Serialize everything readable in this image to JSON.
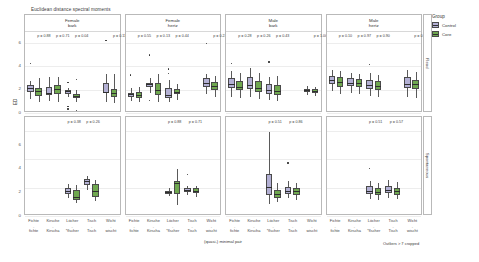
{
  "figure": {
    "title": "Euclidean distance spectral moments",
    "y_axis_label": "ED",
    "caption_center": "(quasi-) minimal pair",
    "caption_right": "Outliers > 7 cropped"
  },
  "legend": {
    "title": "Group",
    "items": [
      {
        "label": "Control",
        "color": "#b3b0d4"
      },
      {
        "label": "Core",
        "color": "#6fa84f"
      }
    ]
  },
  "row_strips": [
    {
      "label": "Read"
    },
    {
      "label": "Spontaneous"
    }
  ],
  "y_ticks": [
    "0",
    "2",
    "4",
    "6"
  ],
  "x_ticks_top": [
    "Fichte",
    "Kirsche",
    "Löcher",
    "Tisch",
    "Wicht"
  ],
  "x_ticks_dash": [
    "-",
    "-",
    "-",
    "-",
    "-"
  ],
  "x_ticks_bottom": [
    "fichte",
    "Kirscha",
    "*flscher",
    "Tisch",
    "wischt"
  ],
  "chart_data": {
    "type": "box",
    "title": "Euclidean distance spectral moments",
    "xlabel": "(quasi-) minimal pair",
    "ylabel": "ED",
    "ylim": [
      0,
      7
    ],
    "grid": true,
    "legend_position": "right",
    "note": "Outliers > 7 cropped",
    "facet_cols": [
      {
        "sex": "Female",
        "scale": "bark"
      },
      {
        "sex": "Female",
        "scale": "hertz"
      },
      {
        "sex": "Male",
        "scale": "bark"
      },
      {
        "sex": "Male",
        "scale": "hertz"
      }
    ],
    "facet_rows": [
      "Read",
      "Spontaneous"
    ],
    "categories": [
      "Fichte",
      "Kirsche",
      "Löcher",
      "Tisch",
      "Wicht"
    ],
    "groups": [
      "Control",
      "Core"
    ],
    "panels": [
      {
        "row": "Read",
        "col": "Female bark",
        "pvalues": [
          {
            "x": 0.5,
            "text": "p = 0.88"
          },
          {
            "x": 1.5,
            "text": "p = 0.71"
          },
          {
            "x": 2.5,
            "text": "p = 0.04"
          },
          {
            "x": 4.5,
            "text": "p = 0.11"
          }
        ],
        "boxes": [
          {
            "cat": "Fichte",
            "group": "Control",
            "q1": 1.75,
            "med": 2.15,
            "q3": 2.35,
            "lo": 1.2,
            "hi": 2.75,
            "outliers": [
              4.2
            ]
          },
          {
            "cat": "Fichte",
            "group": "Core",
            "q1": 1.45,
            "med": 1.85,
            "q3": 2.15,
            "lo": 0.95,
            "hi": 2.95,
            "outliers": []
          },
          {
            "cat": "Kirsche",
            "group": "Control",
            "q1": 1.55,
            "med": 1.7,
            "q3": 2.25,
            "lo": 1.05,
            "hi": 3.1,
            "outliers": []
          },
          {
            "cat": "Kirsche",
            "group": "Core",
            "q1": 1.65,
            "med": 2.05,
            "q3": 2.35,
            "lo": 0.95,
            "hi": 3.05,
            "outliers": []
          },
          {
            "cat": "Löcher",
            "group": "Control",
            "q1": 1.6,
            "med": 1.85,
            "q3": 1.95,
            "lo": 1.35,
            "hi": 2.15,
            "outliers": [
              2.6,
              0.55,
              0.35
            ]
          },
          {
            "cat": "Löcher",
            "group": "Core",
            "q1": 1.25,
            "med": 1.45,
            "q3": 1.6,
            "lo": 0.95,
            "hi": 1.95,
            "outliers": [
              2.85,
              0.2
            ]
          },
          {
            "cat": "Wicht",
            "group": "Control",
            "q1": 1.7,
            "med": 1.8,
            "q3": 2.55,
            "lo": 0.95,
            "hi": 3.35,
            "outliers": [
              6.2
            ]
          },
          {
            "cat": "Wicht",
            "group": "Core",
            "q1": 1.35,
            "med": 1.75,
            "q3": 2.05,
            "lo": 0.85,
            "hi": 3.3,
            "outliers": []
          }
        ]
      },
      {
        "row": "Read",
        "col": "Female hertz",
        "pvalues": [
          {
            "x": 0.5,
            "text": "p = 0.55"
          },
          {
            "x": 1.5,
            "text": "p = 0.13"
          },
          {
            "x": 2.5,
            "text": "p = 0.44"
          },
          {
            "x": 4.5,
            "text": "p = 0.22"
          }
        ],
        "boxes": [
          {
            "cat": "Fichte",
            "group": "Control",
            "q1": 1.4,
            "med": 1.6,
            "q3": 1.75,
            "lo": 1.05,
            "hi": 2.15,
            "outliers": [
              3.25
            ]
          },
          {
            "cat": "Fichte",
            "group": "Core",
            "q1": 1.3,
            "med": 1.55,
            "q3": 1.8,
            "lo": 0.95,
            "hi": 2.25,
            "outliers": []
          },
          {
            "cat": "Kirsche",
            "group": "Control",
            "q1": 2.25,
            "med": 2.45,
            "q3": 2.6,
            "lo": 1.7,
            "hi": 2.95,
            "outliers": [
              4.95,
              1.05
            ]
          },
          {
            "cat": "Kirsche",
            "group": "Core",
            "q1": 1.55,
            "med": 1.95,
            "q3": 2.55,
            "lo": 0.95,
            "hi": 3.35,
            "outliers": []
          },
          {
            "cat": "Löcher",
            "group": "Control",
            "q1": 1.3,
            "med": 1.5,
            "q3": 2.15,
            "lo": 0.9,
            "hi": 2.8,
            "outliers": [
              3.75,
              3.35
            ]
          },
          {
            "cat": "Löcher",
            "group": "Core",
            "q1": 1.6,
            "med": 1.8,
            "q3": 2.05,
            "lo": 1.15,
            "hi": 2.5,
            "outliers": []
          },
          {
            "cat": "Wicht",
            "group": "Control",
            "q1": 2.25,
            "med": 2.6,
            "q3": 2.95,
            "lo": 1.65,
            "hi": 3.3,
            "outliers": [
              5.95
            ]
          },
          {
            "cat": "Wicht",
            "group": "Core",
            "q1": 1.95,
            "med": 2.3,
            "q3": 2.65,
            "lo": 1.35,
            "hi": 3.15,
            "outliers": []
          }
        ]
      },
      {
        "row": "Read",
        "col": "Male bark",
        "pvalues": [
          {
            "x": 0.5,
            "text": "p = 0.28"
          },
          {
            "x": 1.5,
            "text": "p = 0.26"
          },
          {
            "x": 2.5,
            "text": "p = 0.43"
          },
          {
            "x": 4.5,
            "text": "p = 1.00"
          }
        ],
        "boxes": [
          {
            "cat": "Fichte",
            "group": "Control",
            "q1": 2.1,
            "med": 2.45,
            "q3": 2.95,
            "lo": 1.35,
            "hi": 3.55,
            "outliers": [
              4.25
            ]
          },
          {
            "cat": "Fichte",
            "group": "Core",
            "q1": 1.95,
            "med": 2.2,
            "q3": 2.7,
            "lo": 1.25,
            "hi": 3.4,
            "outliers": []
          },
          {
            "cat": "Kirsche",
            "group": "Control",
            "q1": 2.05,
            "med": 2.35,
            "q3": 3.1,
            "lo": 1.4,
            "hi": 3.85,
            "outliers": []
          },
          {
            "cat": "Kirsche",
            "group": "Core",
            "q1": 1.8,
            "med": 2.15,
            "q3": 2.7,
            "lo": 1.2,
            "hi": 3.45,
            "outliers": []
          },
          {
            "cat": "Löcher",
            "group": "Control",
            "q1": 1.65,
            "med": 1.95,
            "q3": 2.45,
            "lo": 1.15,
            "hi": 3.05,
            "outliers": [
              4.35
            ]
          },
          {
            "cat": "Löcher",
            "group": "Core",
            "q1": 1.55,
            "med": 1.9,
            "q3": 2.35,
            "lo": 1.05,
            "hi": 3.2,
            "outliers": []
          },
          {
            "cat": "Wicht",
            "group": "Control",
            "q1": 1.75,
            "med": 1.95,
            "q3": 2.05,
            "lo": 1.5,
            "hi": 2.3,
            "outliers": []
          },
          {
            "cat": "Wicht",
            "group": "Core",
            "q1": 1.7,
            "med": 1.9,
            "q3": 2.05,
            "lo": 1.45,
            "hi": 2.25,
            "outliers": []
          }
        ]
      },
      {
        "row": "Read",
        "col": "Male hertz",
        "pvalues": [
          {
            "x": 0.5,
            "text": "p = 0.10"
          },
          {
            "x": 1.5,
            "text": "p = 0.97"
          },
          {
            "x": 2.5,
            "text": "p = 0.90"
          },
          {
            "x": 4.5,
            "text": "p = 0.96"
          }
        ],
        "boxes": [
          {
            "cat": "Fichte",
            "group": "Control",
            "q1": 2.45,
            "med": 2.85,
            "q3": 3.15,
            "lo": 1.85,
            "hi": 3.65,
            "outliers": []
          },
          {
            "cat": "Fichte",
            "group": "Core",
            "q1": 2.25,
            "med": 2.65,
            "q3": 3.05,
            "lo": 1.6,
            "hi": 3.55,
            "outliers": []
          },
          {
            "cat": "Kirsche",
            "group": "Control",
            "q1": 2.3,
            "med": 2.6,
            "q3": 2.95,
            "lo": 1.7,
            "hi": 3.45,
            "outliers": []
          },
          {
            "cat": "Kirsche",
            "group": "Core",
            "q1": 2.2,
            "med": 2.55,
            "q3": 2.9,
            "lo": 1.65,
            "hi": 3.35,
            "outliers": []
          },
          {
            "cat": "Löcher",
            "group": "Control",
            "q1": 2.05,
            "med": 2.4,
            "q3": 2.85,
            "lo": 1.45,
            "hi": 3.4,
            "outliers": [
              4.15
            ]
          },
          {
            "cat": "Löcher",
            "group": "Core",
            "q1": 1.95,
            "med": 2.3,
            "q3": 2.75,
            "lo": 1.4,
            "hi": 3.25,
            "outliers": []
          },
          {
            "cat": "Wicht",
            "group": "Control",
            "q1": 2.15,
            "med": 2.5,
            "q3": 3.05,
            "lo": 1.35,
            "hi": 3.7,
            "outliers": []
          },
          {
            "cat": "Wicht",
            "group": "Core",
            "q1": 2.05,
            "med": 2.45,
            "q3": 2.85,
            "lo": 1.3,
            "hi": 3.5,
            "outliers": []
          }
        ]
      },
      {
        "row": "Spontaneous",
        "col": "Female bark",
        "pvalues": [
          {
            "x": 2.1,
            "text": "p = 0.38"
          },
          {
            "x": 3.1,
            "text": "p = 0.26"
          }
        ],
        "boxes": [
          {
            "cat": "Löcher",
            "group": "Control",
            "q1": 1.55,
            "med": 1.75,
            "q3": 2.0,
            "lo": 1.3,
            "hi": 2.25,
            "outliers": []
          },
          {
            "cat": "Löcher",
            "group": "Core",
            "q1": 1.15,
            "med": 1.35,
            "q3": 1.85,
            "lo": 0.95,
            "hi": 2.2,
            "outliers": []
          },
          {
            "cat": "Tisch",
            "group": "Control",
            "q1": 2.2,
            "med": 2.45,
            "q3": 2.65,
            "lo": 1.85,
            "hi": 2.85,
            "outliers": []
          },
          {
            "cat": "Tisch",
            "group": "Core",
            "q1": 1.35,
            "med": 1.75,
            "q3": 2.25,
            "lo": 1.05,
            "hi": 2.55,
            "outliers": []
          }
        ]
      },
      {
        "row": "Spontaneous",
        "col": "Female hertz",
        "pvalues": [
          {
            "x": 2.1,
            "text": "p = 0.88"
          },
          {
            "x": 3.2,
            "text": "p = 0.71"
          }
        ],
        "boxes": [
          {
            "cat": "Löcher",
            "group": "Control",
            "q1": 1.55,
            "med": 1.7,
            "q3": 1.8,
            "lo": 1.4,
            "hi": 1.95,
            "outliers": []
          },
          {
            "cat": "Löcher",
            "group": "Core",
            "q1": 1.55,
            "med": 2.3,
            "q3": 2.5,
            "lo": 0.8,
            "hi": 3.35,
            "outliers": []
          },
          {
            "cat": "Tisch",
            "group": "Control",
            "q1": 1.7,
            "med": 1.85,
            "q3": 1.95,
            "lo": 1.45,
            "hi": 2.15,
            "outliers": [
              2.95
            ]
          },
          {
            "cat": "Tisch",
            "group": "Core",
            "q1": 1.6,
            "med": 1.8,
            "q3": 1.95,
            "lo": 1.35,
            "hi": 2.15,
            "outliers": []
          }
        ]
      },
      {
        "row": "Spontaneous",
        "col": "Male bark",
        "pvalues": [
          {
            "x": 2.1,
            "text": "p = 0.51"
          },
          {
            "x": 3.2,
            "text": "p = 0.86"
          }
        ],
        "boxes": [
          {
            "cat": "Löcher",
            "group": "Control",
            "q1": 1.45,
            "med": 2.05,
            "q3": 3.0,
            "lo": 0.85,
            "hi": 5.95,
            "outliers": []
          },
          {
            "cat": "Löcher",
            "group": "Core",
            "q1": 1.3,
            "med": 1.55,
            "q3": 1.85,
            "lo": 1.0,
            "hi": 2.3,
            "outliers": []
          },
          {
            "cat": "Tisch",
            "group": "Control",
            "q1": 1.55,
            "med": 1.8,
            "q3": 2.05,
            "lo": 1.25,
            "hi": 2.45,
            "outliers": [
              3.75
            ]
          },
          {
            "cat": "Tisch",
            "group": "Core",
            "q1": 1.45,
            "med": 1.75,
            "q3": 2.0,
            "lo": 1.15,
            "hi": 2.35,
            "outliers": []
          }
        ]
      },
      {
        "row": "Spontaneous",
        "col": "Male hertz",
        "pvalues": [
          {
            "x": 2.1,
            "text": "p = 0.51"
          },
          {
            "x": 3.2,
            "text": "p = 0.57"
          }
        ],
        "boxes": [
          {
            "cat": "Löcher",
            "group": "Control",
            "q1": 1.55,
            "med": 1.8,
            "q3": 2.1,
            "lo": 1.2,
            "hi": 2.45,
            "outliers": [
              3.35
            ]
          },
          {
            "cat": "Löcher",
            "group": "Core",
            "q1": 1.45,
            "med": 1.7,
            "q3": 1.95,
            "lo": 1.15,
            "hi": 2.3,
            "outliers": []
          },
          {
            "cat": "Tisch",
            "group": "Control",
            "q1": 1.6,
            "med": 1.85,
            "q3": 2.15,
            "lo": 1.25,
            "hi": 2.55,
            "outliers": []
          },
          {
            "cat": "Tisch",
            "group": "Core",
            "q1": 1.5,
            "med": 1.75,
            "q3": 2.0,
            "lo": 1.2,
            "hi": 2.4,
            "outliers": []
          }
        ]
      }
    ]
  }
}
